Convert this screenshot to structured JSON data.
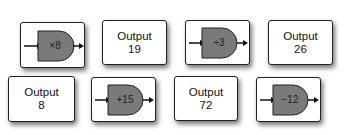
{
  "cards": [
    {
      "type": "operator",
      "op": "×8"
    },
    {
      "type": "output",
      "label": "Output",
      "value": "19"
    },
    {
      "type": "operator",
      "op": "÷3"
    },
    {
      "type": "output",
      "label": "Output",
      "value": "26"
    },
    {
      "type": "output",
      "label": "Output",
      "value": "8"
    },
    {
      "type": "operator",
      "op": "+15"
    },
    {
      "type": "output",
      "label": "Output",
      "value": "72"
    },
    {
      "type": "operator",
      "op": "−12"
    }
  ],
  "colors": {
    "gate_fill": "#7a7a7a",
    "border": "#222222"
  }
}
